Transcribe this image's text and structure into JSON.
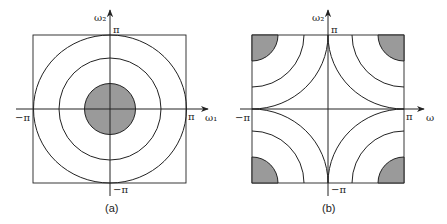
{
  "colors": {
    "line": "#222222",
    "shade": "#9a9a9a",
    "background": "#ffffff"
  },
  "panel_a": {
    "caption": "(a)",
    "y_axis_label": "ω₂",
    "x_axis_label": "ω₁",
    "top_tick": "π",
    "bottom_tick": "−π",
    "left_tick": "−π",
    "right_tick": "π",
    "contours": "concentric circles centered at origin, innermost disc shaded"
  },
  "panel_b": {
    "caption": "(b)",
    "y_axis_label": "ω₂",
    "x_axis_label": "ω",
    "top_tick": "π",
    "bottom_tick": "−π",
    "left_tick": "−π",
    "right_tick": "π",
    "contours": "quarter circles centered at the four corners (±π, ±π), corner regions shaded"
  }
}
